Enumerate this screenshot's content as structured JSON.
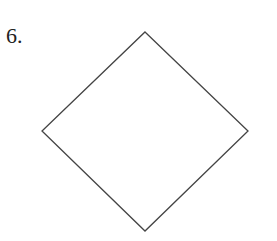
{
  "problem": {
    "number_label": "6."
  },
  "figure": {
    "shape": "square rotated 45 degrees (diamond)",
    "vertices": {
      "top": [
        145,
        32
      ],
      "right": [
        248,
        131
      ],
      "bottom": [
        145,
        231
      ],
      "left": [
        42,
        131
      ]
    },
    "stroke_color": "#444444",
    "fill_color": "#ffffff"
  }
}
